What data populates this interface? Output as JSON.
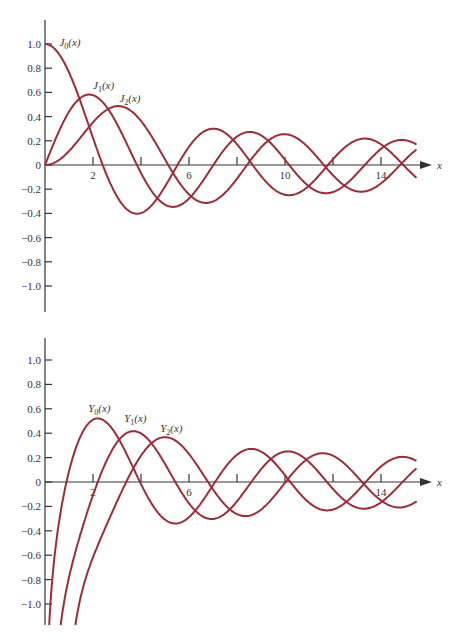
{
  "chart_data": [
    {
      "type": "line",
      "title": "Bessel functions of the first kind",
      "xlabel": "x",
      "ylabel": "",
      "xlim": [
        0,
        15.5
      ],
      "ylim": [
        -1.2,
        1.2
      ],
      "x_ticks": [
        2,
        4,
        6,
        8,
        10,
        12,
        14
      ],
      "x_tick_labels": [
        "2",
        "",
        "6",
        "",
        "10",
        "",
        "14"
      ],
      "y_ticks": [
        1.0,
        0.8,
        0.6,
        0.4,
        0.2,
        0,
        -0.2,
        -0.4,
        -0.6,
        -0.8,
        -1.0
      ],
      "y_tick_labels": [
        "1.0",
        "0.8",
        "0.6",
        "0.4",
        "0.2",
        "0",
        "-0.2",
        "-0.4",
        "-0.6",
        "-0.8",
        "-1.0"
      ],
      "grid": false,
      "legend": "inline labels",
      "series": [
        {
          "name": "J0(x)",
          "fn": "J",
          "order": 0,
          "label": "J",
          "sub": "0",
          "label_x": 0.6,
          "label_y": 0.98,
          "max": {
            "x": 0,
            "y": 1.0
          }
        },
        {
          "name": "J1(x)",
          "fn": "J",
          "order": 1,
          "label": "J",
          "sub": "1",
          "label_x": 2.0,
          "label_y": 0.63,
          "max": {
            "x": 1.84,
            "y": 0.58
          }
        },
        {
          "name": "J2(x)",
          "fn": "J",
          "order": 2,
          "label": "J",
          "sub": "2",
          "label_x": 3.1,
          "label_y": 0.52,
          "max": {
            "x": 3.05,
            "y": 0.49
          }
        }
      ]
    },
    {
      "type": "line",
      "title": "Bessel functions of the second kind",
      "xlabel": "x",
      "ylabel": "",
      "xlim": [
        0,
        15.5
      ],
      "ylim": [
        -1.2,
        1.2
      ],
      "x_ticks": [
        2,
        4,
        6,
        8,
        10,
        12,
        14
      ],
      "x_tick_labels": [
        "2",
        "",
        "6",
        "",
        "",
        "",
        "14"
      ],
      "y_ticks": [
        1.0,
        0.8,
        0.6,
        0.4,
        0.2,
        0,
        -0.2,
        -0.4,
        -0.6,
        -0.8,
        -1.0
      ],
      "y_tick_labels": [
        "1.0",
        "0.8",
        "0.6",
        "0.4",
        "0.2",
        "0",
        "-0.2",
        "-0.4",
        "-0.6",
        "-0.8",
        "-1.0"
      ],
      "grid": false,
      "legend": "inline labels",
      "series": [
        {
          "name": "Y0(x)",
          "fn": "Y",
          "order": 0,
          "label": "Y",
          "sub": "0",
          "label_x": 1.8,
          "label_y": 0.57,
          "max": {
            "x": 2.2,
            "y": 0.52
          }
        },
        {
          "name": "Y1(x)",
          "fn": "Y",
          "order": 1,
          "label": "Y",
          "sub": "1",
          "label_x": 3.3,
          "label_y": 0.49,
          "max": {
            "x": 3.68,
            "y": 0.42
          }
        },
        {
          "name": "Y2(x)",
          "fn": "Y",
          "order": 2,
          "label": "Y",
          "sub": "2",
          "label_x": 4.8,
          "label_y": 0.41,
          "max": {
            "x": 5.0,
            "y": 0.37
          }
        }
      ]
    }
  ],
  "style": {
    "curve_color": "#9b2d3a",
    "axis_color": "#333333"
  },
  "axis_label": "x"
}
